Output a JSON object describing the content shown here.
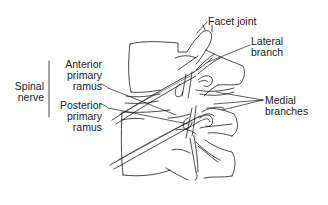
{
  "diagram": {
    "type": "anatomical-line-drawing",
    "labels": {
      "facet_joint": {
        "lines": [
          "Facet joint"
        ]
      },
      "lateral_branch": {
        "lines": [
          "Lateral",
          "branch"
        ]
      },
      "medial_branches": {
        "lines": [
          "Medial",
          "branches"
        ]
      },
      "anterior_primary_ramus": {
        "lines": [
          "Anterior",
          "primary",
          "ramus"
        ]
      },
      "posterior_primary_ramus": {
        "lines": [
          "Posterior",
          "primary",
          "ramus"
        ]
      },
      "spinal_nerve": {
        "lines": [
          "Spinal",
          "nerve"
        ]
      }
    },
    "groupings": [
      {
        "bracket_label": "spinal_nerve",
        "members": [
          "anterior_primary_ramus",
          "posterior_primary_ramus"
        ]
      }
    ],
    "colors": {
      "line": "#1a1a1a",
      "background": "#ffffff"
    }
  }
}
